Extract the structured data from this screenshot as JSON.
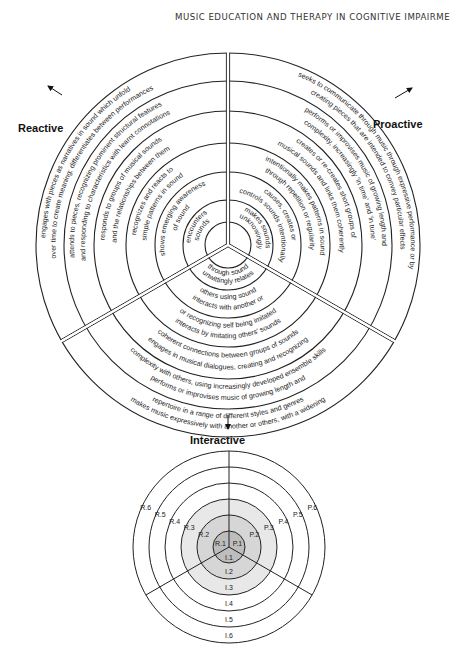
{
  "running_head": "MUSIC EDUCATION AND THERAPY IN COGNITIVE IMPAIRME",
  "diagram_main": {
    "axes": {
      "reactive": "Reactive",
      "proactive": "Proactive",
      "interactive": "Interactive"
    },
    "sectors": {
      "reactive": [
        "encounters sounds",
        "shows emerging awareness of sound",
        "recognizes and reacts to simple patterns in sound",
        "responds to groups of musical sounds and the relationships between them",
        "attends to pieces, recognizing prominent structural features and responding to characteristics with learnt connotations",
        "engages with pieces as narratives in sound which unfold over time to create meaning; differentiates between performances"
      ],
      "proactive": [
        "makes sounds unknowingly",
        "causes, creates or controls sounds intentionally",
        "intentionally makes patterns in sound through repetition or regularity",
        "creates or re-creates short groups of musical sounds and links them coherently",
        "performs or improvises music of growing length and complexity, increasingly 'in time' and 'in tune'",
        "seeks to communicate through music through expressive performance or by creating pieces that are intended to convey particular effects"
      ],
      "interactive": [
        "unwittingly relates through sound",
        "interacts with another or others using sound",
        "interacts by imitating others' sounds or recognizing self being imitated",
        "engages in musical dialogues, creating and recognizing coherent connections between groups of sounds",
        "performs or improvises music of growing length and complexity with others, using increasingly developed ensemble skills",
        "makes music expressively with another or others, with a widening repertoire in a range of different styles and genres"
      ]
    }
  },
  "diagram_key": {
    "reactive_labels": [
      "R.1",
      "R.2",
      "R.3",
      "R.4",
      "R.5",
      "R.6"
    ],
    "proactive_labels": [
      "P.1",
      "P.2",
      "P.3",
      "P.4",
      "P.5",
      "P.6"
    ],
    "interactive_labels": [
      "I.1",
      "I.2",
      "I.3",
      "I.4",
      "I.5",
      "I.6"
    ],
    "shading": [
      "#bdbdbd",
      "#d6d6d6",
      "#e8e8e8",
      "#ffffff",
      "#ffffff",
      "#ffffff"
    ]
  }
}
